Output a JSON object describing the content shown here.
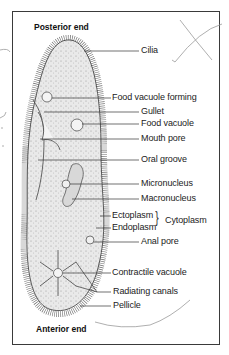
{
  "diagram": {
    "ends": {
      "posterior": "Posterior end",
      "anterior": "Anterior end"
    },
    "labels": {
      "cilia": "Cilia",
      "food_vacuole_forming": "Food vacuole forming",
      "gullet": "Gullet",
      "food_vacuole": "Food vacuole",
      "mouth_pore": "Mouth pore",
      "oral_groove": "Oral groove",
      "micronucleus": "Micronucleus",
      "macronucleus": "Macronucleus",
      "ectoplasm": "Ectoplasm",
      "endoplasm": "Endoplasm",
      "cytoplasm": "Cytoplasm",
      "anal_pore": "Anal pore",
      "contractile_vacuole": "Contractile vacuole",
      "radiating_canals": "Radiating canals",
      "pellicle": "Pellicle"
    },
    "colors": {
      "line": "#333333",
      "cell_fill": "#e6e6e6",
      "nucleus_fill": "#d0d0d0",
      "pencil": "#9a9a9a"
    }
  }
}
